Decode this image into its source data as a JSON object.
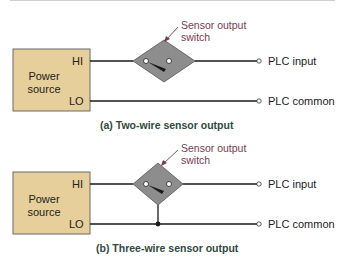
{
  "diagrams": [
    {
      "id": "a",
      "power_source": {
        "label_line1": "Power",
        "label_line2": "source",
        "hi": "HI",
        "lo": "LO"
      },
      "switch_callout": {
        "line1": "Sensor output",
        "line2": "switch"
      },
      "outputs": {
        "input": "PLC input",
        "common": "PLC common"
      },
      "caption": "(a) Two-wire sensor output"
    },
    {
      "id": "b",
      "power_source": {
        "label_line1": "Power",
        "label_line2": "source",
        "hi": "HI",
        "lo": "LO"
      },
      "switch_callout": {
        "line1": "Sensor output",
        "line2": "switch"
      },
      "outputs": {
        "input": "PLC input",
        "common": "PLC common"
      },
      "caption": "(b) Three-wire sensor output"
    }
  ],
  "colors": {
    "power_box_fill": "#e6cf9a",
    "power_box_border": "#6b6b6b",
    "switch_fill": "#8d8d8d",
    "wire": "#1a1a1a",
    "callout_text": "#7a3b52",
    "caption_text": "#2f4a3e"
  }
}
